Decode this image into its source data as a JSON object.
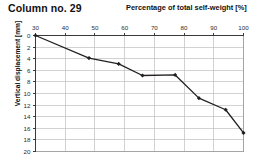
{
  "figure": {
    "title": "Column no. 29",
    "background_color": "#ffffff"
  },
  "chart_data": {
    "type": "line",
    "title": "Column no. 29",
    "xlabel": "Percentage of total self-weight [%]",
    "ylabel": "Vertical displacement [mm]",
    "xlabel_position": "top",
    "x_axis_position": "top",
    "y_axis_inverted": true,
    "xlim": [
      30,
      100
    ],
    "ylim": [
      0,
      20
    ],
    "xticks": [
      30,
      40,
      50,
      60,
      70,
      80,
      90,
      100
    ],
    "yticks": [
      0,
      2,
      4,
      6,
      8,
      10,
      12,
      14,
      16,
      18,
      20
    ],
    "xtick_labels": [
      "30",
      "40",
      "50",
      "60",
      "70",
      "80",
      "90",
      "100"
    ],
    "ytick_labels": [
      "0",
      "2",
      "4",
      "6",
      "8",
      "10",
      "12",
      "14",
      "16",
      "18",
      "20"
    ],
    "grid": true,
    "grid_color": "#bfbfbf",
    "legend": false,
    "line_color": "#231f20",
    "marker": "diamond",
    "marker_color": "#231f20",
    "x": [
      30,
      48,
      58,
      66,
      77,
      85,
      94,
      100
    ],
    "values": [
      0.0,
      3.9,
      4.9,
      6.9,
      6.8,
      10.8,
      12.8,
      16.8
    ],
    "series": [
      {
        "name": "Column no. 29",
        "points": [
          {
            "x": 30,
            "y": 0.0
          },
          {
            "x": 48,
            "y": 3.9
          },
          {
            "x": 58,
            "y": 4.9
          },
          {
            "x": 66,
            "y": 6.9
          },
          {
            "x": 77,
            "y": 6.8
          },
          {
            "x": 85,
            "y": 10.8
          },
          {
            "x": 94,
            "y": 12.8
          },
          {
            "x": 100,
            "y": 16.8
          }
        ]
      }
    ]
  }
}
